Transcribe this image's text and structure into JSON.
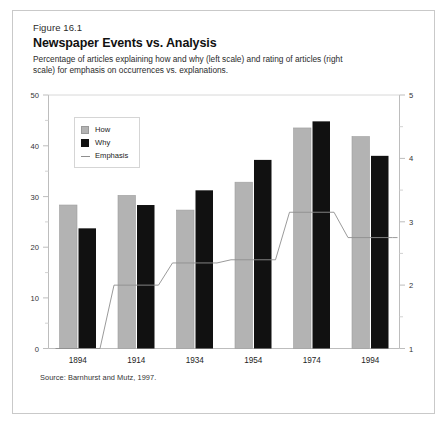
{
  "figure": {
    "number": "Figure 16.1",
    "title": "Newspaper Events vs. Analysis",
    "subtitle": "Percentage of articles explaining how and why (left scale) and rating of articles (right scale) for emphasis on occurrences vs. explanations.",
    "source": "Source: Barnhurst and Mutz, 1997."
  },
  "legend": {
    "position": "upper-left-inside",
    "items": [
      {
        "label": "How",
        "marker": "filled-square",
        "color": "#b3b3b3"
      },
      {
        "label": "Why",
        "marker": "filled-square",
        "color": "#111111"
      },
      {
        "label": "Emphasis",
        "marker": "line",
        "color": "#8f8f8f"
      }
    ]
  },
  "axes": {
    "left": {
      "ticks": [
        "0",
        "10",
        "20",
        "30",
        "40",
        "50"
      ],
      "values": [
        0,
        10,
        20,
        30,
        40,
        50
      ],
      "min": 0,
      "max": 50,
      "minor_step": 5
    },
    "right": {
      "ticks": [
        "1",
        "2",
        "3",
        "4",
        "5"
      ],
      "values": [
        1,
        2,
        3,
        4,
        5
      ],
      "min": 1,
      "max": 5,
      "minor_step": 0.5
    },
    "categories": [
      "1894",
      "1914",
      "1934",
      "1954",
      "1974",
      "1994"
    ]
  },
  "chart_data": {
    "type": "bar",
    "title": "Newspaper Events vs. Analysis",
    "subtitle": "Percentage of articles explaining how and why (left scale) and rating of articles (right scale) for emphasis on occurrences vs. explanations.",
    "categories": [
      "1894",
      "1914",
      "1934",
      "1954",
      "1974",
      "1994"
    ],
    "xlabel": "",
    "ylabel": "",
    "ylim": [
      0,
      50
    ],
    "y2lim": [
      1,
      5
    ],
    "grid": false,
    "legend": "upper left",
    "series": [
      {
        "name": "How",
        "type": "bar",
        "axis": "left",
        "color": "#b3b3b3",
        "values": [
          28.3,
          30.2,
          27.3,
          32.8,
          43.5,
          41.8
        ]
      },
      {
        "name": "Why",
        "type": "bar",
        "axis": "left",
        "color": "#111111",
        "values": [
          23.7,
          28.3,
          31.2,
          37.2,
          44.8,
          38.0
        ]
      },
      {
        "name": "Emphasis",
        "type": "line",
        "axis": "right",
        "color": "#8f8f8f",
        "values": [
          1.0,
          2.0,
          2.35,
          2.4,
          3.15,
          2.75
        ]
      }
    ],
    "source": "Source: Barnhurst and Mutz, 1997."
  }
}
